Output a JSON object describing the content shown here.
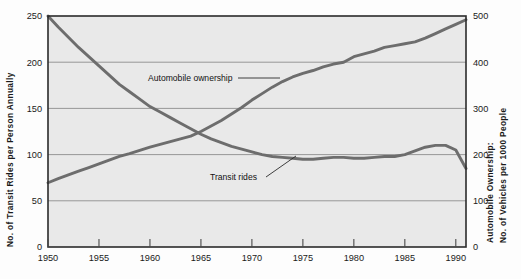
{
  "figure": {
    "background_color": "#fdfdfd",
    "plot_background_color": "#e9e9e9",
    "plot_border_color": "#2b2b2b",
    "gridline_color": "#8d8d8d",
    "line_color": "#6d6d6d"
  },
  "chart_data": {
    "type": "line",
    "title": "",
    "subtitle": "",
    "xlabel": "",
    "ylabel": "No. of Transit Rides per Person Annually",
    "y2label_line1": "Automobile Ownership:",
    "y2label_line2": "No. of Vehicles per 1000 People",
    "xlim": [
      1950,
      1991
    ],
    "ylim": [
      0,
      250
    ],
    "y2lim": [
      0,
      500
    ],
    "grid": true,
    "grid_axis": "y",
    "legend_position": "inline-annotation",
    "xticks": [
      1950,
      1955,
      1960,
      1965,
      1970,
      1975,
      1980,
      1985,
      1990
    ],
    "xtick_labels": [
      "1950",
      "1955",
      "1960",
      "1965",
      "1970",
      "1975",
      "1980",
      "1985",
      "1990"
    ],
    "yticks": [
      0,
      50,
      100,
      150,
      200,
      250
    ],
    "ytick_labels": [
      "0",
      "50",
      "100",
      "150",
      "200",
      "250"
    ],
    "y2ticks": [
      0,
      100,
      200,
      300,
      400,
      500
    ],
    "y2tick_labels": [
      "0",
      "100",
      "200",
      "300",
      "400",
      "500"
    ],
    "series": [
      {
        "name": "Transit rides",
        "axis": "left",
        "units": "rides per person annually",
        "x": [
          1950,
          1951,
          1952,
          1953,
          1954,
          1955,
          1956,
          1957,
          1958,
          1959,
          1960,
          1961,
          1962,
          1963,
          1964,
          1965,
          1966,
          1967,
          1968,
          1969,
          1970,
          1971,
          1972,
          1973,
          1974,
          1975,
          1976,
          1977,
          1978,
          1979,
          1980,
          1981,
          1982,
          1983,
          1984,
          1985,
          1986,
          1987,
          1988,
          1989,
          1990,
          1991
        ],
        "values": [
          250,
          238,
          227,
          216,
          206,
          196,
          186,
          176,
          168,
          160,
          152,
          146,
          140,
          134,
          128,
          122,
          117,
          113,
          109,
          106,
          103,
          100,
          98,
          97,
          96,
          95,
          95,
          96,
          97,
          97,
          96,
          96,
          97,
          98,
          98,
          100,
          104,
          108,
          110,
          110,
          105,
          85
        ]
      },
      {
        "name": "Automobile ownership",
        "axis": "right",
        "units": "vehicles per 1000 people",
        "x": [
          1950,
          1951,
          1952,
          1953,
          1954,
          1955,
          1956,
          1957,
          1958,
          1959,
          1960,
          1961,
          1962,
          1963,
          1964,
          1965,
          1966,
          1967,
          1968,
          1969,
          1970,
          1971,
          1972,
          1973,
          1974,
          1975,
          1976,
          1977,
          1978,
          1979,
          1980,
          1981,
          1982,
          1983,
          1984,
          1985,
          1986,
          1987,
          1988,
          1989,
          1990,
          1991
        ],
        "values": [
          139,
          148,
          156,
          164,
          172,
          180,
          188,
          196,
          202,
          209,
          216,
          222,
          228,
          234,
          240,
          250,
          262,
          274,
          288,
          302,
          318,
          332,
          346,
          358,
          368,
          376,
          382,
          390,
          396,
          400,
          412,
          418,
          424,
          432,
          436,
          440,
          444,
          452,
          462,
          472,
          482,
          492
        ]
      }
    ],
    "annotations": [
      {
        "text": "Automobile ownership",
        "x_px": 148,
        "y_px": 81,
        "leader": true
      },
      {
        "text": "Transit rides",
        "x_px": 210,
        "y_px": 180,
        "leader": true
      }
    ]
  }
}
